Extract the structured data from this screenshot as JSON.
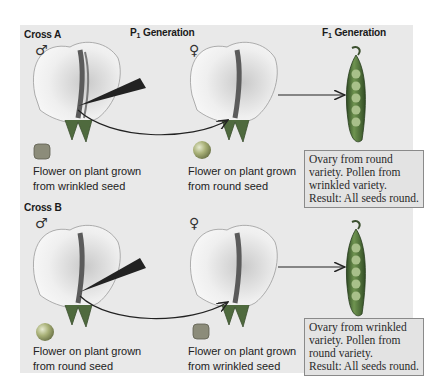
{
  "headers": {
    "p1": "P",
    "p1_sub": "1",
    "p1_rest": " Generation",
    "f1": "F",
    "f1_sub": "1",
    "f1_rest": " Generation"
  },
  "cross_a": {
    "title": "Cross A",
    "male_symbol": "♂",
    "female_symbol": "♀",
    "male_caption": [
      "Flower on plant grown",
      "from wrinkled seed"
    ],
    "female_caption": [
      "Flower on plant grown",
      "from round seed"
    ],
    "result_lines": [
      "Ovary from round",
      "variety. Pollen from",
      "wrinkled variety.",
      "Result:  All seeds round."
    ]
  },
  "cross_b": {
    "title": "Cross B",
    "male_symbol": "♂",
    "female_symbol": "♀",
    "male_caption": [
      "Flower on plant grown",
      "from round seed"
    ],
    "female_caption": [
      "Flower on plant grown",
      "from wrinkled seed"
    ],
    "result_lines": [
      "Ovary from wrinkled",
      "variety. Pollen from",
      "round variety.",
      "Result:  All seeds round."
    ]
  },
  "colors": {
    "panel": "#e9e9e9",
    "result_box": "#e3e3e3",
    "result_border": "#8a8a8a",
    "pod_green": "#4f7a3c",
    "seed_round": "#9aa36a",
    "seed_wrinkled": "#8c8c7a"
  }
}
